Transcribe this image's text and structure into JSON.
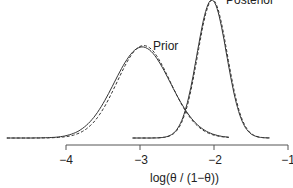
{
  "chart_data": {
    "type": "line",
    "title": "",
    "xlabel": "log(θ / (1−θ))",
    "ylabel": "",
    "xlim": [
      -4.6,
      -1
    ],
    "x_ticks": [
      -4,
      -3,
      -2,
      -1
    ],
    "x_tick_labels": [
      "−4",
      "−3",
      "−2",
      "−1"
    ],
    "grid": false,
    "legend": "none",
    "annotations": [
      {
        "text": "Prior",
        "x": -2.9,
        "near": "prior peak"
      },
      {
        "text": "Posterior",
        "x": -1.9,
        "near": "posterior peak"
      }
    ],
    "series": [
      {
        "name": "Prior (exact)",
        "style": "solid",
        "mean": -2.97,
        "sd": 0.38,
        "peak_rel": 0.66,
        "x_range": [
          -4.8,
          -1.8
        ]
      },
      {
        "name": "Prior (approximation)",
        "style": "dashed",
        "mean": -2.95,
        "sd": 0.36,
        "peak_rel": 0.67,
        "x_range": [
          -4.8,
          -1.8
        ]
      },
      {
        "name": "Posterior (exact)",
        "style": "solid",
        "mean": -2.03,
        "sd": 0.2,
        "peak_rel": 1.0,
        "x_range": [
          -3.1,
          -1.25
        ]
      },
      {
        "name": "Posterior (approximation)",
        "style": "dashed",
        "mean": -2.02,
        "sd": 0.2,
        "peak_rel": 1.0,
        "x_range": [
          -3.1,
          -1.25
        ]
      }
    ]
  },
  "labels": {
    "prior": "Prior",
    "posterior": "Posterior",
    "xlabel": "log(θ / (1−θ))",
    "ticks": [
      "−4",
      "−3",
      "−2",
      "−1"
    ]
  }
}
